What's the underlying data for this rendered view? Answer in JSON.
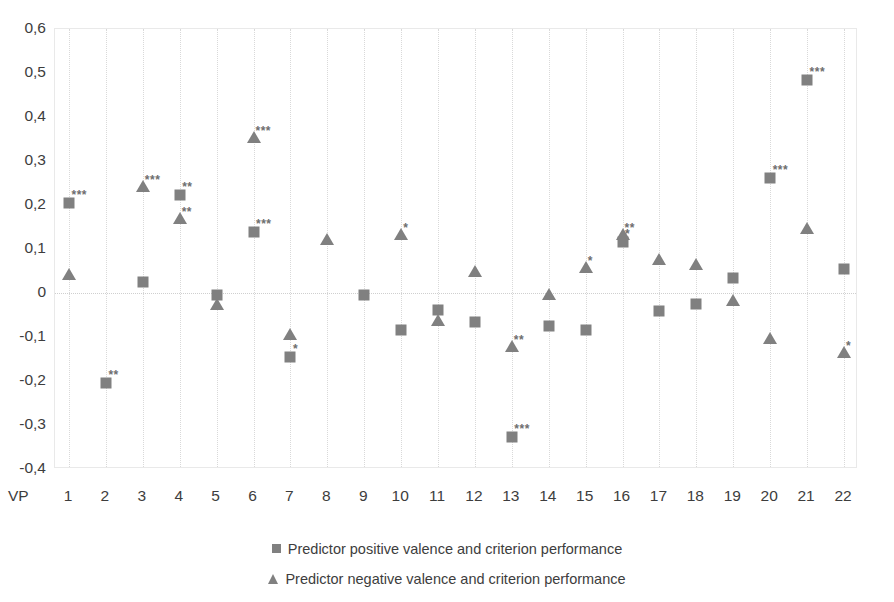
{
  "chart_data": {
    "type": "scatter",
    "title": "",
    "xlabel": "VP",
    "ylabel": "",
    "xlim": [
      0.5,
      22.5
    ],
    "ylim": [
      -0.4,
      0.6
    ],
    "grid": "vertical dotted gridlines plus dotted zero line",
    "legend_position": "bottom-center",
    "x_axis_prefix_label": "VP",
    "categories": [
      "1",
      "2",
      "3",
      "4",
      "5",
      "6",
      "7",
      "8",
      "9",
      "10",
      "11",
      "12",
      "13",
      "14",
      "15",
      "16",
      "17",
      "18",
      "19",
      "20",
      "21",
      "22"
    ],
    "y_ticks": [
      "0,6",
      "0,5",
      "0,4",
      "0,3",
      "0,2",
      "0,1",
      "0",
      "-0,1",
      "-0,2",
      "-0,3",
      "-0,4"
    ],
    "y_tick_values": [
      0.6,
      0.5,
      0.4,
      0.3,
      0.2,
      0.1,
      0,
      -0.1,
      -0.2,
      -0.3,
      -0.4
    ],
    "series": [
      {
        "name": "Predictor positive valence and criterion performance",
        "marker": "square",
        "color": "#808080",
        "values": [
          0.205,
          -0.205,
          0.025,
          0.222,
          -0.005,
          0.138,
          -0.145,
          null,
          -0.005,
          -0.085,
          -0.038,
          -0.065,
          -0.328,
          -0.075,
          -0.085,
          0.115,
          -0.042,
          -0.025,
          0.033,
          0.262,
          0.485,
          0.055
        ],
        "significance": [
          "***",
          "**",
          "",
          "**",
          "",
          "***",
          "*",
          "",
          "",
          "",
          "",
          "",
          "***",
          "",
          "",
          "*",
          "",
          "",
          "",
          "***",
          "***",
          ""
        ]
      },
      {
        "name": "Predictor negative valence and criterion performance",
        "marker": "triangle",
        "color": "#808080",
        "values": [
          0.043,
          null,
          0.243,
          0.17,
          -0.025,
          0.355,
          -0.093,
          0.122,
          null,
          0.133,
          -0.062,
          0.05,
          -0.12,
          -0.002,
          0.058,
          0.135,
          0.078,
          0.065,
          -0.015,
          -0.102,
          0.148,
          -0.133
        ],
        "significance": [
          "",
          "",
          "***",
          "**",
          "",
          "***",
          "",
          "",
          "",
          "*",
          "",
          "",
          "**",
          "",
          "*",
          "**",
          "",
          "",
          "",
          "",
          "",
          "*"
        ]
      }
    ],
    "legend": [
      {
        "marker": "square",
        "label": "Predictor positive valence and criterion performance"
      },
      {
        "marker": "triangle",
        "label": "Predictor negative valence and criterion performance"
      }
    ]
  }
}
